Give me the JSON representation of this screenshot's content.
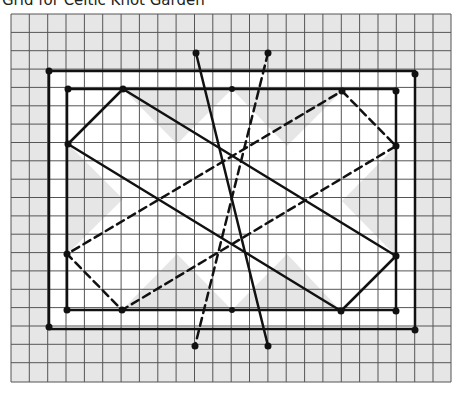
{
  "title": "Grid for Celtic Knot Garden",
  "grid": {
    "x0": 11,
    "y0": 14,
    "cols": 24,
    "rows": 20,
    "cell": 18.35,
    "fill": "#e6e6e6",
    "line": "#555555"
  },
  "colors": {
    "ink": "#111111",
    "white": "#ffffff",
    "gray": "#e6e6e6"
  },
  "shapes": {
    "outer_rect": {
      "x1": 49,
      "y1": 71,
      "x2": 415,
      "y2": 329
    },
    "inner_rect": {
      "x1": 67,
      "y1": 89,
      "x2": 396,
      "y2": 310
    },
    "solid_diamond": [
      [
        123,
        89
      ],
      [
        396,
        256
      ],
      [
        341,
        311
      ],
      [
        68,
        144
      ]
    ],
    "dashed_diamond": [
      [
        342,
        91
      ],
      [
        396,
        146
      ],
      [
        122,
        310
      ],
      [
        67,
        254
      ]
    ],
    "solid_line": [
      [
        196,
        53
      ],
      [
        268,
        346
      ]
    ],
    "dashed_line": [
      [
        268,
        53
      ],
      [
        195,
        346
      ]
    ]
  }
}
